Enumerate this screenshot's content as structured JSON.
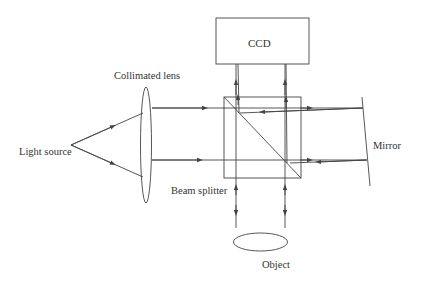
{
  "diagram": {
    "labels": {
      "light_source": "Light source",
      "collimated_lens": "Collimated lens",
      "ccd": "CCD",
      "beam_splitter": "Beam splitter",
      "mirror": "Mirror",
      "object": "Object"
    },
    "colors": {
      "line": "#444444",
      "text": "#333333",
      "background": "#ffffff"
    },
    "components": [
      {
        "id": "light-source",
        "type": "point",
        "x": 71,
        "y": 145
      },
      {
        "id": "collimated-lens",
        "type": "ellipse",
        "cx": 146,
        "cy": 145,
        "rx": 5,
        "ry": 47
      },
      {
        "id": "ccd",
        "type": "rect",
        "x": 216,
        "y": 18,
        "w": 93,
        "h": 46
      },
      {
        "id": "beam-splitter",
        "type": "cube",
        "x": 224,
        "y": 97,
        "w": 77,
        "h": 81
      },
      {
        "id": "mirror",
        "type": "line",
        "x1": 362,
        "y1": 97,
        "x2": 370,
        "y2": 186
      },
      {
        "id": "object",
        "type": "ellipse",
        "cx": 274,
        "cy": 242,
        "rx": 27,
        "ry": 9
      }
    ]
  }
}
